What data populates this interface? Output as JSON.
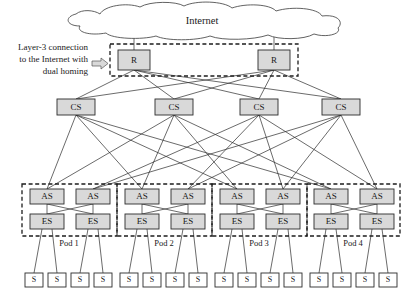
{
  "figure": {
    "type": "network-topology-diagram",
    "title_text": "Internet",
    "annotation": {
      "lines": [
        "Layer-3 connection",
        "to the Internet with",
        "dual homing"
      ],
      "arrow_icon": "right-arrow-icon"
    }
  },
  "layers": {
    "cloud": {
      "label": "Internet"
    },
    "routers": {
      "label": "R",
      "nodes": [
        {
          "label": "R",
          "x": 118,
          "y": 50,
          "w": 32,
          "h": 20
        },
        {
          "label": "R",
          "x": 258,
          "y": 50,
          "w": 32,
          "h": 20
        }
      ],
      "group_box": {
        "x": 110,
        "y": 44,
        "w": 188,
        "h": 32
      }
    },
    "core_switches": {
      "label": "CS",
      "nodes": [
        {
          "label": "CS",
          "x": 57,
          "y": 99,
          "w": 38,
          "h": 16
        },
        {
          "label": "CS",
          "x": 155,
          "y": 99,
          "w": 38,
          "h": 16
        },
        {
          "label": "CS",
          "x": 240,
          "y": 99,
          "w": 38,
          "h": 16
        },
        {
          "label": "CS",
          "x": 322,
          "y": 99,
          "w": 38,
          "h": 16
        }
      ]
    },
    "pods": [
      {
        "name": "Pod 1",
        "box": {
          "x": 22,
          "y": 184,
          "w": 95,
          "h": 52
        },
        "aggregation_switches": [
          {
            "label": "AS",
            "x": 30,
            "y": 189,
            "w": 34,
            "h": 15
          },
          {
            "label": "AS",
            "x": 76,
            "y": 189,
            "w": 34,
            "h": 15
          }
        ],
        "edge_switches": [
          {
            "label": "ES",
            "x": 30,
            "y": 214,
            "w": 34,
            "h": 15
          },
          {
            "label": "ES",
            "x": 76,
            "y": 214,
            "w": 34,
            "h": 15
          }
        ],
        "servers": [
          {
            "label": "S",
            "x": 25,
            "y": 273,
            "w": 18,
            "h": 14
          },
          {
            "label": "S",
            "x": 48,
            "y": 273,
            "w": 18,
            "h": 14
          },
          {
            "label": "S",
            "x": 71,
            "y": 273,
            "w": 18,
            "h": 14
          },
          {
            "label": "S",
            "x": 94,
            "y": 273,
            "w": 18,
            "h": 14
          }
        ]
      },
      {
        "name": "Pod 2",
        "box": {
          "x": 117,
          "y": 184,
          "w": 95,
          "h": 52
        },
        "aggregation_switches": [
          {
            "label": "AS",
            "x": 125,
            "y": 189,
            "w": 34,
            "h": 15
          },
          {
            "label": "AS",
            "x": 171,
            "y": 189,
            "w": 34,
            "h": 15
          }
        ],
        "edge_switches": [
          {
            "label": "ES",
            "x": 125,
            "y": 214,
            "w": 34,
            "h": 15
          },
          {
            "label": "ES",
            "x": 171,
            "y": 214,
            "w": 34,
            "h": 15
          }
        ],
        "servers": [
          {
            "label": "S",
            "x": 120,
            "y": 273,
            "w": 18,
            "h": 14
          },
          {
            "label": "S",
            "x": 143,
            "y": 273,
            "w": 18,
            "h": 14
          },
          {
            "label": "S",
            "x": 166,
            "y": 273,
            "w": 18,
            "h": 14
          },
          {
            "label": "S",
            "x": 189,
            "y": 273,
            "w": 18,
            "h": 14
          }
        ]
      },
      {
        "name": "Pod 3",
        "box": {
          "x": 212,
          "y": 184,
          "w": 95,
          "h": 52
        },
        "aggregation_switches": [
          {
            "label": "AS",
            "x": 220,
            "y": 189,
            "w": 34,
            "h": 15
          },
          {
            "label": "AS",
            "x": 266,
            "y": 189,
            "w": 34,
            "h": 15
          }
        ],
        "edge_switches": [
          {
            "label": "ES",
            "x": 220,
            "y": 214,
            "w": 34,
            "h": 15
          },
          {
            "label": "ES",
            "x": 266,
            "y": 214,
            "w": 34,
            "h": 15
          }
        ],
        "servers": [
          {
            "label": "S",
            "x": 215,
            "y": 273,
            "w": 18,
            "h": 14
          },
          {
            "label": "S",
            "x": 238,
            "y": 273,
            "w": 18,
            "h": 14
          },
          {
            "label": "S",
            "x": 261,
            "y": 273,
            "w": 18,
            "h": 14
          },
          {
            "label": "S",
            "x": 284,
            "y": 273,
            "w": 18,
            "h": 14
          }
        ]
      },
      {
        "name": "Pod 4",
        "box": {
          "x": 307,
          "y": 184,
          "w": 93,
          "h": 52
        },
        "aggregation_switches": [
          {
            "label": "AS",
            "x": 314,
            "y": 189,
            "w": 34,
            "h": 15
          },
          {
            "label": "AS",
            "x": 360,
            "y": 189,
            "w": 34,
            "h": 15
          }
        ],
        "edge_switches": [
          {
            "label": "ES",
            "x": 314,
            "y": 214,
            "w": 34,
            "h": 15
          },
          {
            "label": "ES",
            "x": 360,
            "y": 214,
            "w": 34,
            "h": 15
          }
        ],
        "servers": [
          {
            "label": "S",
            "x": 310,
            "y": 273,
            "w": 18,
            "h": 14
          },
          {
            "label": "S",
            "x": 333,
            "y": 273,
            "w": 18,
            "h": 14
          },
          {
            "label": "S",
            "x": 356,
            "y": 273,
            "w": 18,
            "h": 14
          },
          {
            "label": "S",
            "x": 379,
            "y": 273,
            "w": 18,
            "h": 14
          }
        ]
      }
    ]
  },
  "colors": {
    "shaded_fill": "#d9d9d9",
    "plain_fill": "#ffffff",
    "stroke": "#2b2b2b",
    "dashed_stroke": "#1c1c1c",
    "text": "#1a1a1a"
  }
}
